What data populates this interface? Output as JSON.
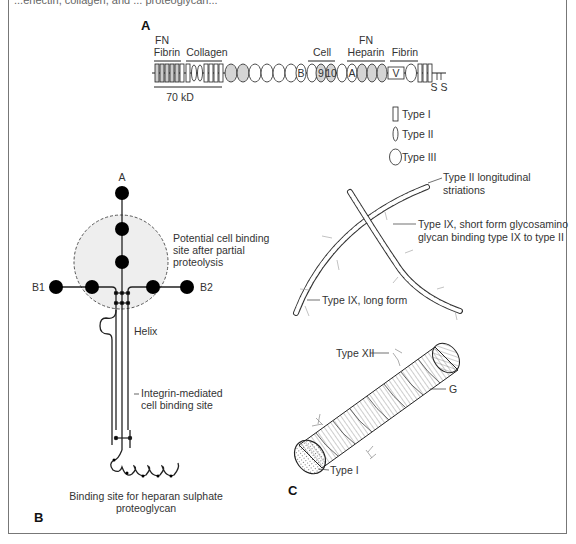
{
  "figure": {
    "top_cut_text": "...enectin, collagen, and ... proteoglycan...",
    "panels": {
      "a": {
        "letter": "A",
        "domain_labels": {
          "fn_fibrin_1": "FN",
          "fn_fibrin_2": "Fibrin",
          "collagen": "Collagen",
          "cell": "Cell",
          "fn_heparin_1": "FN",
          "fn_heparin_2": "Heparin",
          "fibrin": "Fibrin",
          "kd": "70 kD",
          "ss": "S S",
          "module_b": "B",
          "module_9": "9",
          "module_10": "10",
          "module_a": "A",
          "module_v": "V"
        },
        "legend": [
          {
            "shape": "rectangle",
            "label": "Type I"
          },
          {
            "shape": "narrow-ellipse",
            "label": "Type II"
          },
          {
            "shape": "ellipse",
            "label": "Type III"
          }
        ]
      },
      "b": {
        "letter": "B",
        "labels": {
          "a": "A",
          "b1": "B1",
          "b2": "B2",
          "potential_1": "Potential cell binding",
          "potential_2": "site after partial",
          "potential_3": "proteolysis",
          "helix": "Helix",
          "integrin_1": "Integrin-mediated",
          "integrin_2": "cell binding site",
          "heparan_1": "Binding site for heparan sulphate",
          "heparan_2": "proteoglycan"
        }
      },
      "c": {
        "letter": "C",
        "labels": {
          "type2_1": "Type II longitudinal",
          "type2_2": "striations",
          "type9s_1": "Type IX, short form glycosamino",
          "type9s_2": "glycan binding type IX to type II",
          "type9l": "Type IX, long form",
          "type12": "Type XII",
          "g": "G",
          "type1": "Type I"
        }
      }
    },
    "colors": {
      "line": "#222222",
      "shaded_module": "#d4d4d4",
      "circle_fill": "#eeeeee",
      "frame": "#777777"
    }
  }
}
